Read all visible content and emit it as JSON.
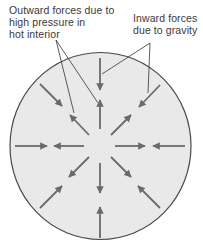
{
  "diagram": {
    "type": "force-balance-sphere",
    "labels": {
      "outward": {
        "lines": [
          "Outward forces due to",
          "high pressure in",
          "hot interior"
        ]
      },
      "inward": {
        "lines": [
          "Inward forces",
          "due to gravity"
        ]
      }
    },
    "colors": {
      "circle_fill": "#e9e9e9",
      "circle_stroke": "#4a4a4a",
      "arrow": "#6a6a6a",
      "leader": "#333333",
      "text": "#3a3a3a"
    },
    "arrow_directions": [
      "N",
      "NE",
      "E",
      "SE",
      "S",
      "SW",
      "W",
      "NW"
    ],
    "arrow_pairs": 8
  }
}
